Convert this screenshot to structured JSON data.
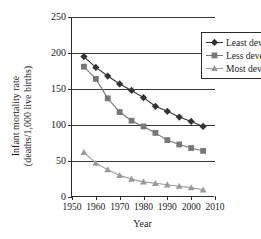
{
  "figure": {
    "top_text_sliver": "",
    "background": "#ffffff"
  },
  "axes": {
    "x_title": "Year",
    "y_title_line1": "Infant mortality rate",
    "y_title_line2": "(deaths/1,000 live births)",
    "x_ticks": [
      "1950",
      "1960",
      "1970",
      "1980",
      "1990",
      "2000",
      "2010"
    ],
    "y_ticks": [
      "0",
      "50",
      "100",
      "150",
      "200",
      "250"
    ]
  },
  "legend": {
    "items": [
      {
        "label": "Least developed",
        "marker": "diamond-marker",
        "color": "#333333"
      },
      {
        "label": "Less developed",
        "marker": "square-marker",
        "color": "#777777"
      },
      {
        "label": "Most developed",
        "marker": "triangle-marker",
        "color": "#9a9a9a"
      }
    ]
  },
  "chart_data": {
    "type": "line",
    "title": "",
    "xlabel": "Year",
    "ylabel": "Infant mortality rate (deaths/1,000 live births)",
    "xlim": [
      1950,
      2010
    ],
    "ylim": [
      0,
      250
    ],
    "xticks": [
      1950,
      1960,
      1970,
      1980,
      1990,
      2000,
      2010
    ],
    "yticks": [
      0,
      50,
      100,
      150,
      200,
      250
    ],
    "grid": "horizontal",
    "legend_position": "top-right-inside",
    "x": [
      1955,
      1960,
      1965,
      1970,
      1975,
      1980,
      1985,
      1990,
      1995,
      2000,
      2005
    ],
    "series": [
      {
        "name": "Least developed",
        "marker": "diamond",
        "color": "#333333",
        "values": [
          195,
          180,
          168,
          157,
          148,
          138,
          126,
          119,
          111,
          105,
          98
        ]
      },
      {
        "name": "Less developed",
        "marker": "square",
        "color": "#777777",
        "values": [
          181,
          164,
          137,
          118,
          106,
          98,
          89,
          79,
          73,
          68,
          64
        ]
      },
      {
        "name": "Most developed",
        "marker": "triangle",
        "color": "#9a9a9a",
        "values": [
          62,
          47,
          38,
          30,
          25,
          21,
          19,
          17,
          15,
          13,
          10
        ]
      }
    ]
  }
}
